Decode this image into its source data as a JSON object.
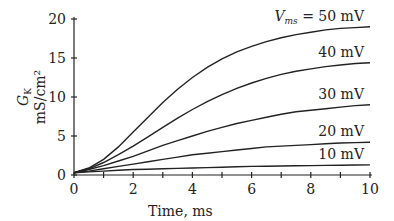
{
  "chart_data": {
    "type": "line",
    "title": "",
    "xlabel": "Time, ms",
    "ylabel_main": "G",
    "ylabel_sub": "K",
    "ylabel_units": "mS/cm²",
    "xlim": [
      0,
      10
    ],
    "ylim": [
      0,
      20
    ],
    "xticks": [
      0,
      2,
      4,
      6,
      8,
      10
    ],
    "xminor": [
      1,
      3,
      5,
      7,
      9
    ],
    "yticks": [
      0,
      5,
      10,
      15,
      20
    ],
    "grid": false,
    "x": [
      0,
      0.5,
      1,
      1.5,
      2,
      2.5,
      3,
      3.5,
      4,
      4.5,
      5,
      5.5,
      6,
      6.5,
      7,
      7.5,
      8,
      8.5,
      9,
      9.5,
      10
    ],
    "series": [
      {
        "name": "50 mV",
        "label_prefix": "V",
        "label_sub": "ms",
        "label_eq": " = 50 mV",
        "values": [
          0.3,
          0.9,
          2.0,
          3.6,
          5.5,
          7.4,
          9.3,
          11.0,
          12.5,
          13.8,
          14.9,
          15.8,
          16.5,
          17.1,
          17.6,
          18.0,
          18.3,
          18.6,
          18.8,
          18.9,
          19.0
        ]
      },
      {
        "name": "40 mV",
        "label": "40 mV",
        "values": [
          0.3,
          0.8,
          1.6,
          2.6,
          3.7,
          4.9,
          6.1,
          7.3,
          8.4,
          9.4,
          10.3,
          11.1,
          11.8,
          12.4,
          12.9,
          13.3,
          13.6,
          13.9,
          14.1,
          14.3,
          14.4
        ]
      },
      {
        "name": "30 mV",
        "label": "30 mV",
        "values": [
          0.3,
          0.7,
          1.2,
          1.8,
          2.4,
          3.1,
          3.8,
          4.4,
          5.0,
          5.6,
          6.1,
          6.6,
          7.0,
          7.4,
          7.8,
          8.1,
          8.3,
          8.5,
          8.7,
          8.9,
          9.0
        ]
      },
      {
        "name": "20 mV",
        "label": "20 mV",
        "values": [
          0.3,
          0.5,
          0.8,
          1.1,
          1.4,
          1.7,
          2.0,
          2.3,
          2.6,
          2.8,
          3.0,
          3.2,
          3.4,
          3.6,
          3.7,
          3.8,
          3.9,
          4.0,
          4.1,
          4.15,
          4.2
        ]
      },
      {
        "name": "10 mV",
        "label": "10 mV",
        "values": [
          0.3,
          0.4,
          0.5,
          0.6,
          0.7,
          0.75,
          0.8,
          0.85,
          0.9,
          0.95,
          1.0,
          1.05,
          1.1,
          1.12,
          1.15,
          1.18,
          1.2,
          1.23,
          1.25,
          1.28,
          1.3
        ]
      }
    ]
  }
}
